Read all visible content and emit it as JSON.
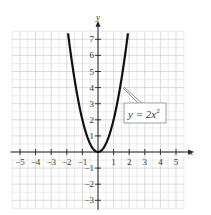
{
  "chart_data": {
    "type": "line",
    "title": "",
    "xlabel": "x",
    "ylabel": "y",
    "xlim": [
      -5.5,
      5.5
    ],
    "ylim": [
      -3.5,
      7.5
    ],
    "grid": true,
    "x_ticks": [
      -5,
      -4,
      -3,
      -2,
      -1,
      1,
      2,
      3,
      4,
      5
    ],
    "y_ticks": [
      -3,
      -2,
      -1,
      1,
      2,
      3,
      4,
      5,
      6,
      7
    ],
    "series": [
      {
        "name": "y = 2x^2",
        "function": "y = 2x^2",
        "x": [
          -1.9,
          -1.5,
          -1,
          -0.5,
          0,
          0.5,
          1,
          1.5,
          1.9
        ],
        "values": [
          7.22,
          4.5,
          2,
          0.5,
          0,
          0.5,
          2,
          4.5,
          7.22
        ]
      }
    ],
    "annotations": [
      {
        "text": "y = 2x²",
        "points_to": [
          1.5,
          4.5
        ]
      }
    ]
  },
  "labels": {
    "x_axis": "x",
    "y_axis": "y",
    "curve_label": "y = 2x",
    "curve_label_exp": "2"
  }
}
